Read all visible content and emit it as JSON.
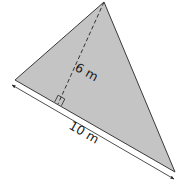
{
  "figure": {
    "shape": "triangle",
    "fill_color": "#c4c4c4",
    "stroke_color": "#333333",
    "vertices": {
      "apex": [
        104,
        2
      ],
      "left": [
        15,
        80
      ],
      "right": [
        175,
        172
      ]
    },
    "altitude": {
      "foot": [
        58,
        104
      ],
      "style": "dashed",
      "right_angle_marker": true,
      "label": "6 m"
    },
    "base": {
      "label": "10 m",
      "dimension_line": true,
      "arrowheads": "both"
    }
  }
}
